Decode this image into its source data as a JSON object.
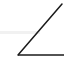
{
  "icon": {
    "name": "angle-icon",
    "stroke_color": "#1a1a1a",
    "background": "#ffffff",
    "band_color": "#f1f1f1",
    "label": "Angle"
  }
}
